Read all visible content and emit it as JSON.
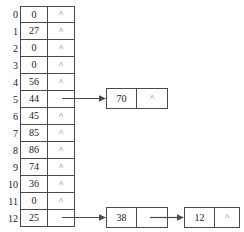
{
  "diagram": {
    "null_symbol": "^",
    "line_color": "#4a4a4a",
    "text_color": "#1a1a1a",
    "background": "#ffffff"
  },
  "table": {
    "index_header": "",
    "rows": [
      {
        "index": "0",
        "value": "0",
        "pointer": "^",
        "has_chain": false
      },
      {
        "index": "1",
        "value": "27",
        "pointer": "^",
        "has_chain": false
      },
      {
        "index": "2",
        "value": "0",
        "pointer": "^",
        "has_chain": false
      },
      {
        "index": "3",
        "value": "0",
        "pointer": "^",
        "has_chain": false
      },
      {
        "index": "4",
        "value": "56",
        "pointer": "^",
        "has_chain": false
      },
      {
        "index": "5",
        "value": "44",
        "pointer": "",
        "has_chain": true
      },
      {
        "index": "6",
        "value": "45",
        "pointer": "^",
        "has_chain": false
      },
      {
        "index": "7",
        "value": "85",
        "pointer": "^",
        "has_chain": false
      },
      {
        "index": "8",
        "value": "86",
        "pointer": "^",
        "has_chain": false
      },
      {
        "index": "9",
        "value": "74",
        "pointer": "^",
        "has_chain": false
      },
      {
        "index": "10",
        "value": "36",
        "pointer": "^",
        "has_chain": false
      },
      {
        "index": "11",
        "value": "0",
        "pointer": "^",
        "has_chain": false
      },
      {
        "index": "12",
        "value": "25",
        "pointer": "",
        "has_chain": true
      }
    ]
  },
  "chains": [
    {
      "from_index": "5",
      "nodes": [
        {
          "value": "70",
          "pointer": "^"
        }
      ]
    },
    {
      "from_index": "12",
      "nodes": [
        {
          "value": "38",
          "pointer": ""
        },
        {
          "value": "12",
          "pointer": "^"
        }
      ]
    }
  ]
}
